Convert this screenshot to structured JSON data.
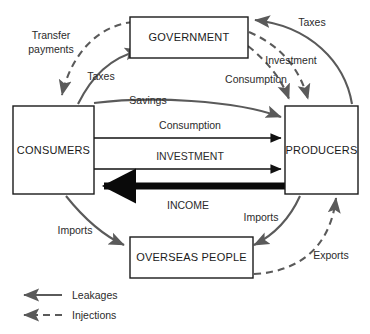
{
  "diagram": {
    "nodes": [
      {
        "id": "government",
        "label": "GOVERNMENT"
      },
      {
        "id": "consumers",
        "label": "CONSUMERS"
      },
      {
        "id": "producers",
        "label": "PRODUCERS"
      },
      {
        "id": "overseas",
        "label": "OVERSEAS PEOPLE"
      }
    ],
    "flows": [
      {
        "id": "transfer-payments",
        "label": "Transfer\npayments",
        "line1": "Transfer",
        "line2": "payments",
        "type": "injection",
        "from": "government",
        "to": "consumers"
      },
      {
        "id": "taxes-consumers",
        "label": "Taxes",
        "type": "leakage",
        "from": "consumers",
        "to": "government"
      },
      {
        "id": "savings",
        "label": "Savings",
        "type": "leakage",
        "from": "consumers",
        "to": "producers"
      },
      {
        "id": "taxes-producers",
        "label": "Taxes",
        "type": "leakage",
        "from": "producers",
        "to": "government"
      },
      {
        "id": "investment-gov",
        "label": "Investment",
        "type": "injection",
        "from": "government",
        "to": "producers"
      },
      {
        "id": "consumption-gov",
        "label": "Consumption",
        "type": "injection",
        "from": "government",
        "to": "producers"
      },
      {
        "id": "consumption-main",
        "label": "Consumption",
        "type": "main",
        "from": "consumers",
        "to": "producers"
      },
      {
        "id": "investment-main",
        "label": "INVESTMENT",
        "type": "main",
        "from": "consumers",
        "to": "producers"
      },
      {
        "id": "income-main",
        "label": "INCOME",
        "type": "main-bold",
        "from": "producers",
        "to": "consumers"
      },
      {
        "id": "imports-consumers",
        "label": "Imports",
        "type": "leakage",
        "from": "consumers",
        "to": "overseas"
      },
      {
        "id": "imports-producers",
        "label": "Imports",
        "type": "leakage",
        "from": "producers",
        "to": "overseas"
      },
      {
        "id": "exports",
        "label": "Exports",
        "type": "injection",
        "from": "overseas",
        "to": "producers"
      }
    ],
    "legend": [
      {
        "id": "leakages",
        "label": "Leakages",
        "style": "solid"
      },
      {
        "id": "injections",
        "label": "Injections",
        "style": "dashed"
      }
    ],
    "colors": {
      "background": "#ffffff",
      "box_stroke": "#1a1a1a",
      "curve_stroke": "#5a5a5a",
      "straight_stroke": "#111111",
      "income_stroke": "#0a0a0a",
      "text": "#2b2b2b"
    }
  }
}
